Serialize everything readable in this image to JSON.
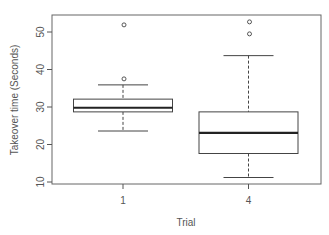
{
  "chart_data": {
    "type": "boxplot",
    "title": "",
    "xlabel": "Trial",
    "ylabel": "Takeover time (Seconds)",
    "categories": [
      "1",
      "4"
    ],
    "ylim": [
      10,
      55
    ],
    "yticks": [
      10,
      20,
      30,
      40,
      50
    ],
    "grid": false,
    "legend": null,
    "series": [
      {
        "name": "1",
        "whisker_low": 23.6,
        "q1": 28.7,
        "median": 29.8,
        "q3": 32.1,
        "whisker_high": 35.9,
        "outliers": [
          37.5,
          51.9
        ]
      },
      {
        "name": "4",
        "whisker_low": 11.2,
        "q1": 17.6,
        "median": 23.1,
        "q3": 28.7,
        "whisker_high": 43.7,
        "outliers": [
          49.5,
          52.7
        ]
      }
    ]
  },
  "colors": {
    "axis": "#555555",
    "box": "#444444",
    "median": "#222222",
    "text": "#555555"
  }
}
